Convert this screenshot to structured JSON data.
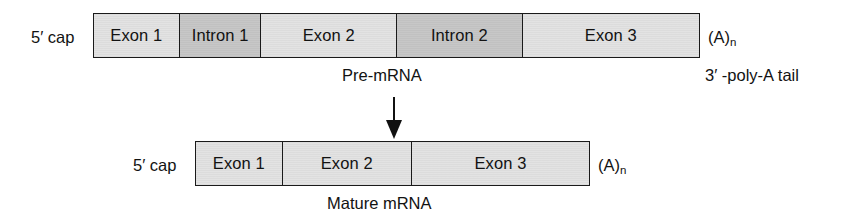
{
  "diagram": {
    "colors": {
      "exon_fill": "#e2e2e2",
      "intron_fill": "#c6c6c6",
      "stroke": "#1a1a1a",
      "text": "#121212",
      "background": "#ffffff"
    }
  },
  "pre_mrna": {
    "left_label": "5′ cap",
    "right_label": "(A)",
    "right_label_sub": "n",
    "caption": "Pre-mRNA",
    "tail_note": "3′ -poly-A tail",
    "segments": [
      {
        "label": "Exon 1",
        "type": "exon"
      },
      {
        "label": "Intron 1",
        "type": "intron"
      },
      {
        "label": "Exon 2",
        "type": "exon"
      },
      {
        "label": "Intron 2",
        "type": "intron"
      },
      {
        "label": "Exon 3",
        "type": "exon"
      }
    ]
  },
  "mature_mrna": {
    "left_label": "5′ cap",
    "right_label": "(A)",
    "right_label_sub": "n",
    "caption": "Mature mRNA",
    "segments": [
      {
        "label": "Exon 1",
        "type": "exon"
      },
      {
        "label": "Exon 2",
        "type": "exon"
      },
      {
        "label": "Exon 3",
        "type": "exon"
      }
    ]
  },
  "process_arrow": {
    "direction": "down",
    "meaning": "splicing"
  }
}
